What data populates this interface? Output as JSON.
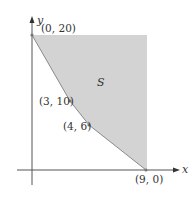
{
  "diagram": {
    "type": "feasible-region",
    "axes": {
      "x_label": "x",
      "y_label": "y"
    },
    "region": {
      "label": "S",
      "fill": "#d3d3d3",
      "unbounded": true
    },
    "vertices": [
      {
        "label": "(0, 20)",
        "x": 0,
        "y": 20
      },
      {
        "label": "(3, 10)",
        "x": 3,
        "y": 10
      },
      {
        "label": "(4, 6)",
        "x": 4,
        "y": 6
      },
      {
        "label": "(9, 0)",
        "x": 9,
        "y": 0
      }
    ],
    "colors": {
      "axis": "#444444",
      "boundary": "#888888",
      "point": "#777777"
    }
  }
}
